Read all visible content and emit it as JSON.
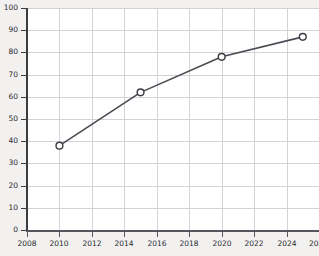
{
  "chart_data": {
    "type": "line",
    "title": "",
    "subtitle": "",
    "xlabel": "",
    "ylabel": "",
    "x": [
      2010,
      2015,
      2020,
      2025
    ],
    "values": [
      38,
      62,
      78,
      87
    ],
    "series": [
      {
        "name": "",
        "x": [
          2010,
          2015,
          2020,
          2025
        ],
        "values": [
          38,
          62,
          78,
          87
        ]
      }
    ],
    "xlim": [
      2008,
      2026
    ],
    "ylim": [
      0,
      100
    ],
    "x_ticks": [
      2008,
      2010,
      2012,
      2014,
      2016,
      2018,
      2020,
      2022,
      2024,
      2026
    ],
    "x_tick_labels": [
      "2008",
      "2010",
      "2012",
      "2014",
      "2016",
      "2018",
      "2020",
      "2022",
      "2024",
      "202"
    ],
    "y_ticks": [
      0,
      10,
      20,
      30,
      40,
      50,
      60,
      70,
      80,
      90,
      100
    ],
    "y_tick_labels": [
      "0",
      "10",
      "20",
      "30",
      "40",
      "50",
      "60",
      "70",
      "80",
      "90",
      "100"
    ],
    "grid": true,
    "grid_axis": "both",
    "legend": false,
    "legend_position": "none",
    "marker": "open-circle",
    "annotations": []
  },
  "style": {
    "line_color": "#4a4a52",
    "marker_edge_color": "#3c3c42",
    "marker_face_color": "#ffffff",
    "grid_color": "#d3d3d6",
    "axis_color": "#3c3c42",
    "plot_background": "#ffffff",
    "page_background": "#f2f1f0",
    "tick_label_color": "#2a2a30"
  }
}
